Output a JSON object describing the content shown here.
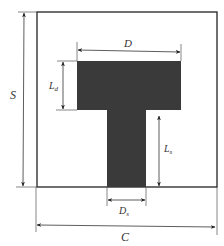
{
  "diagram": {
    "type": "T-shaped patch geometry with dimensions",
    "colors": {
      "background": "#ffffff",
      "outline": "#222222",
      "patch": "#3a3a3a",
      "dimension_line": "#333333"
    },
    "labels": {
      "S": "S",
      "C": "C",
      "D": "D",
      "Ld": "L",
      "Ld_sub": "d",
      "Ls": "L",
      "Ls_sub": "s",
      "Ds": "D",
      "Ds_sub": "s"
    }
  }
}
